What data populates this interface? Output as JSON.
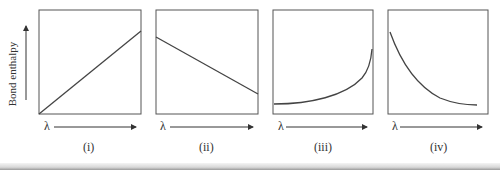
{
  "figure": {
    "y_axis_label": "Bond enthalpy",
    "x_axis_symbol": "λ",
    "panels": [
      {
        "label": "(i)",
        "curve": "linear increasing"
      },
      {
        "label": "(ii)",
        "curve": "linear decreasing"
      },
      {
        "label": "(iii)",
        "curve": "increasing, concave up (exponential rise)"
      },
      {
        "label": "(iv)",
        "curve": "decreasing, concave up (exponential decay)"
      }
    ]
  },
  "colors": {
    "line": "#444444",
    "frame": "#555555"
  }
}
